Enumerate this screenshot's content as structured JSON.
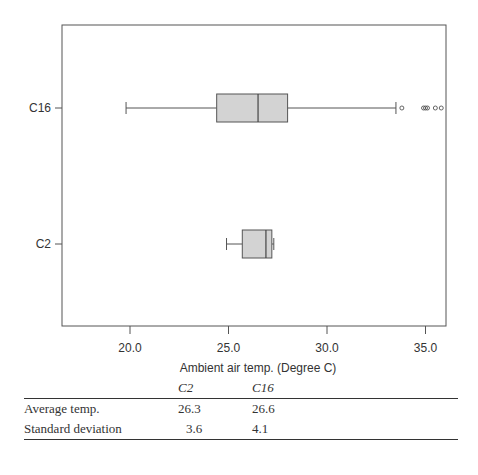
{
  "chart_data": {
    "type": "boxplot",
    "orientation": "horizontal",
    "title": "",
    "xlabel": "Ambient air temp. (Degree C)",
    "ylabel": "",
    "xlim": [
      16.5,
      36.0
    ],
    "xticks": [
      20.0,
      25.0,
      30.0,
      35.0
    ],
    "xtick_labels": [
      "20.0",
      "25.0",
      "30.0",
      "35.0"
    ],
    "grid": false,
    "categories": [
      "C16",
      "C2"
    ],
    "series": [
      {
        "name": "C16",
        "whisker_low": 19.8,
        "q1": 24.4,
        "median": 26.5,
        "q3": 28.0,
        "whisker_high": 33.5,
        "outliers": [
          33.8,
          34.9,
          35.0,
          35.1,
          35.5,
          35.8
        ]
      },
      {
        "name": "C2",
        "whisker_low": 24.9,
        "q1": 25.7,
        "median": 26.9,
        "q3": 27.2,
        "whisker_high": 27.3,
        "outliers": []
      }
    ],
    "box_fill": "#d3d3d3",
    "line_color": "#555555"
  },
  "axis": {
    "x_label": "Ambient air temp. (Degree C)",
    "ticks": [
      "20.0",
      "25.0",
      "30.0",
      "35.0"
    ],
    "y_labels": [
      "C16",
      "C2"
    ]
  },
  "table": {
    "headers": [
      "",
      "C2",
      "C16"
    ],
    "rows": [
      {
        "label": "Average temp.",
        "c2": "26.3",
        "c16": "26.6"
      },
      {
        "label": "Standard deviation",
        "c2": "3.6",
        "c16": "4.1"
      }
    ]
  }
}
